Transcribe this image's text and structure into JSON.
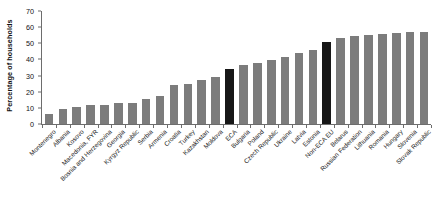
{
  "chart_data": {
    "type": "bar",
    "title": "",
    "subtitle": "",
    "xlabel": "",
    "ylabel": "Percentage of households",
    "ylim": [
      0,
      70
    ],
    "yticks": [
      0,
      10,
      20,
      30,
      40,
      50,
      60,
      70
    ],
    "grid": false,
    "legend": "none",
    "colors": {
      "bar_default": "#7c7c7c",
      "bar_highlight": "#171717",
      "axis": "#6d6d6d",
      "background": "#ffffff",
      "text": "#1a1a1a"
    },
    "highlighted_categories": [
      "ECA",
      "Non-ECA EU"
    ],
    "categories": [
      "Montenegro",
      "Albania",
      "Kosovo",
      "Macedonia, FYR",
      "Bosnia and Herzegovina",
      "Georgia",
      "Kyrgyz Republic",
      "Serbia",
      "Armenia",
      "Croatia",
      "Turkey",
      "Kazakhstan",
      "Moldova",
      "ECA",
      "Bulgaria",
      "Poland",
      "Czech Republic",
      "Ukraine",
      "Latvia",
      "Estonia",
      "Non-ECA EU",
      "Belarus",
      "Russian Federation",
      "Lithuania",
      "Romania",
      "Hungary",
      "Slovenia",
      "Slovak Republic"
    ],
    "values": [
      6,
      9.5,
      10.5,
      11.8,
      11.5,
      13,
      12.8,
      15.8,
      17.5,
      24,
      24.8,
      27.5,
      29.3,
      34,
      36.5,
      38,
      39.8,
      41.5,
      44,
      46,
      51,
      53,
      54.5,
      55,
      55.5,
      56.5,
      57,
      57
    ]
  }
}
